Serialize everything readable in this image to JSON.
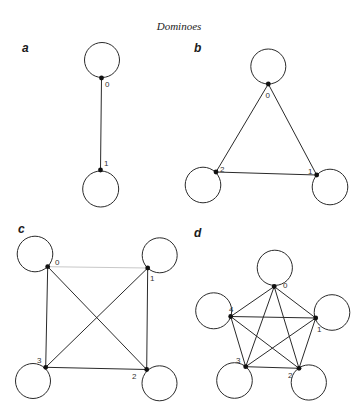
{
  "title": "Dominoes",
  "colors": {
    "ink": "#2a2a2a",
    "faint_edge": "#c8c8c8",
    "background": "#ffffff"
  },
  "panels": [
    {
      "label": "a",
      "nodes": [
        {
          "id": "0",
          "x": 101.5,
          "y": 78,
          "loop": {
            "cx": 102,
            "cy": 60,
            "r": 17.5
          },
          "label_pos": {
            "x": 105,
            "y": 87
          }
        },
        {
          "id": "1",
          "x": 100.5,
          "y": 170,
          "loop": {
            "cx": 100.7,
            "cy": 189,
            "r": 18
          },
          "label_pos": {
            "x": 104,
            "y": 166
          }
        }
      ],
      "edges": [
        [
          "0",
          "1"
        ]
      ]
    },
    {
      "label": "b",
      "nodes": [
        {
          "id": "0",
          "x": 268.3,
          "y": 84,
          "loop": {
            "cx": 268.3,
            "cy": 66.5,
            "r": 17.5
          },
          "label_pos": {
            "x": 265.5,
            "y": 98
          }
        },
        {
          "id": "1",
          "x": 316.7,
          "y": 175,
          "loop": {
            "cx": 330,
            "cy": 187,
            "r": 17.8
          },
          "label_pos": {
            "x": 308,
            "y": 174
          }
        },
        {
          "id": "2",
          "x": 216,
          "y": 172,
          "loop": {
            "cx": 203,
            "cy": 185,
            "r": 17.8
          },
          "label_pos": {
            "x": 220,
            "y": 172
          }
        }
      ],
      "edges": [
        [
          "0",
          "1"
        ],
        [
          "0",
          "2"
        ],
        [
          "1",
          "2"
        ]
      ]
    },
    {
      "label": "c",
      "nodes": [
        {
          "id": "0",
          "x": 47.7,
          "y": 266.7,
          "loop": {
            "cx": 35,
            "cy": 254,
            "r": 17.8
          },
          "label_pos": {
            "x": 55,
            "y": 265
          }
        },
        {
          "id": "1",
          "x": 147.7,
          "y": 268,
          "loop": {
            "cx": 159.7,
            "cy": 255.3,
            "r": 17.5
          },
          "label_pos": {
            "x": 150,
            "y": 281
          }
        },
        {
          "id": "2",
          "x": 146.7,
          "y": 369.5,
          "loop": {
            "cx": 159.5,
            "cy": 383.3,
            "r": 17.5
          },
          "label_pos": {
            "x": 132,
            "y": 379
          }
        },
        {
          "id": "3",
          "x": 45.7,
          "y": 367.3,
          "loop": {
            "cx": 33,
            "cy": 381,
            "r": 17.5
          },
          "label_pos": {
            "x": 37,
            "y": 363
          }
        }
      ],
      "edges": [
        [
          "0",
          "1",
          "faint"
        ],
        [
          "0",
          "2"
        ],
        [
          "0",
          "3"
        ],
        [
          "1",
          "2"
        ],
        [
          "1",
          "3"
        ],
        [
          "2",
          "3"
        ]
      ]
    },
    {
      "label": "d",
      "nodes": [
        {
          "id": "0",
          "x": 274.2,
          "y": 286.5,
          "loop": {
            "cx": 274.8,
            "cy": 267.8,
            "r": 17.6
          },
          "label_pos": {
            "x": 283,
            "y": 288
          }
        },
        {
          "id": "1",
          "x": 315.7,
          "y": 318,
          "loop": {
            "cx": 332,
            "cy": 312.5,
            "r": 17.8
          },
          "label_pos": {
            "x": 317,
            "y": 332
          }
        },
        {
          "id": "2",
          "x": 299,
          "y": 368.3,
          "loop": {
            "cx": 308.8,
            "cy": 382.5,
            "r": 17.6
          },
          "label_pos": {
            "x": 288,
            "y": 378
          }
        },
        {
          "id": "3",
          "x": 245.7,
          "y": 366.7,
          "loop": {
            "cx": 234.5,
            "cy": 380.5,
            "r": 17.8
          },
          "label_pos": {
            "x": 236,
            "y": 363
          }
        },
        {
          "id": "4",
          "x": 230.7,
          "y": 316.5,
          "loop": {
            "cx": 213.7,
            "cy": 310.8,
            "r": 18
          },
          "label_pos": {
            "x": 229,
            "y": 312
          }
        }
      ],
      "edges": [
        [
          "0",
          "1"
        ],
        [
          "0",
          "2"
        ],
        [
          "0",
          "3"
        ],
        [
          "0",
          "4"
        ],
        [
          "1",
          "2"
        ],
        [
          "1",
          "3"
        ],
        [
          "1",
          "4"
        ],
        [
          "2",
          "3"
        ],
        [
          "2",
          "4"
        ],
        [
          "3",
          "4"
        ]
      ]
    }
  ],
  "panel_label_positions": [
    {
      "x": 22,
      "y": 52
    },
    {
      "x": 194,
      "y": 52
    },
    {
      "x": 18,
      "y": 233
    },
    {
      "x": 194,
      "y": 237
    }
  ]
}
